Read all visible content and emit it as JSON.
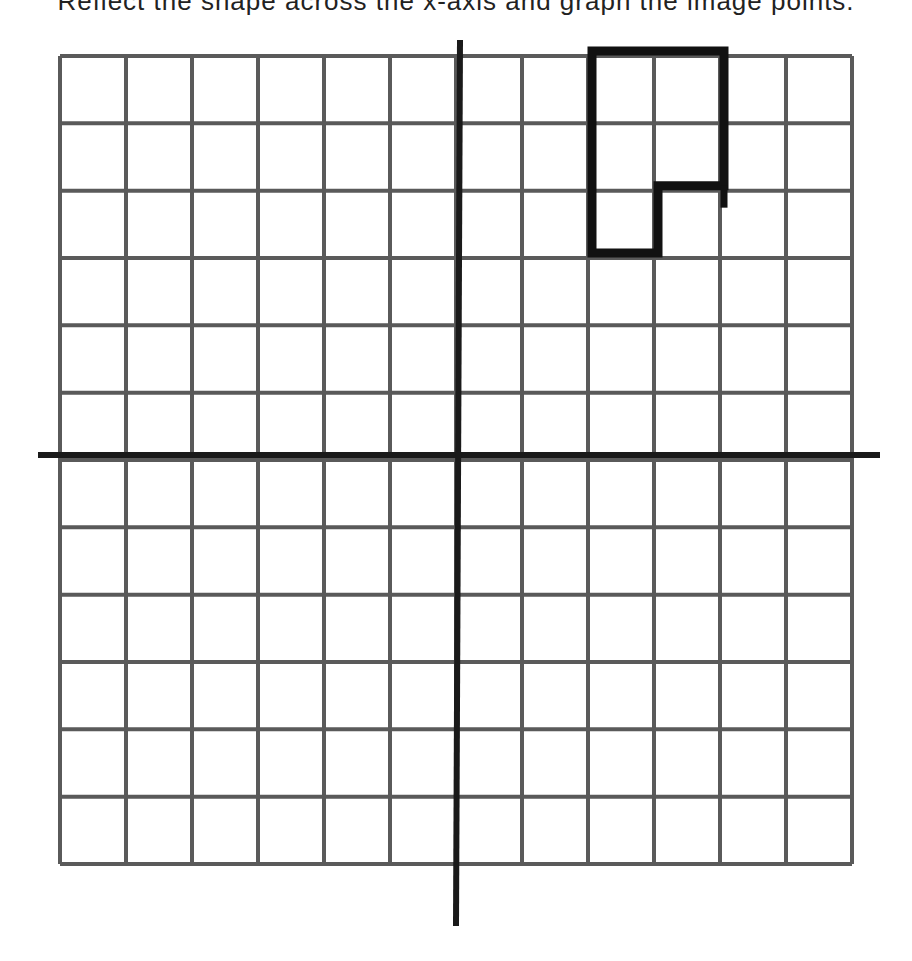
{
  "header": {
    "cut_off_text": "Reflect the shape across the x-axis and graph the image points."
  },
  "colors": {
    "grid": "#5a5a5a",
    "axis": "#1a1a1a",
    "shape": "#111111",
    "background": "#ffffff"
  },
  "grid": {
    "columns": 12,
    "rows": 12,
    "x_min": -6,
    "x_max": 6,
    "y_min": -6,
    "y_max": 6,
    "left_px": 60,
    "right_px": 852,
    "top_px": 56,
    "bottom_px": 864
  },
  "axes": {
    "origin_px": [
      460,
      455
    ],
    "x_axis": {
      "from_px": 38,
      "to_px": 880
    },
    "y_axis": {
      "from_px": 40,
      "to_px": 926
    }
  },
  "shape": {
    "name": "L-shaped polygon",
    "vertices": [
      [
        2,
        6
      ],
      [
        4,
        6
      ],
      [
        4,
        4
      ],
      [
        3,
        4
      ],
      [
        3,
        3
      ],
      [
        2,
        3
      ]
    ],
    "stroke_width": 9
  },
  "chart_data": {
    "type": "scatter",
    "title": "",
    "xlabel": "",
    "ylabel": "",
    "xlim": [
      -6,
      6
    ],
    "ylim": [
      -6,
      6
    ],
    "grid": true,
    "series": [
      {
        "name": "shape",
        "closed": true,
        "x": [
          2,
          4,
          4,
          3,
          3,
          2
        ],
        "y": [
          6,
          6,
          4,
          4,
          3,
          3
        ]
      }
    ]
  }
}
